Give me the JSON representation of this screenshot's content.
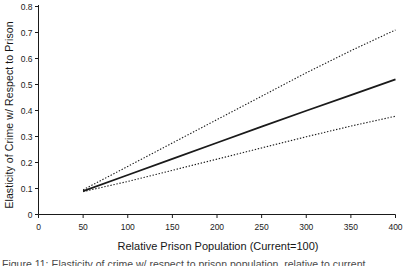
{
  "chart_data": {
    "type": "line",
    "title": "",
    "xlabel": "Relative Prison Population (Current=100)",
    "ylabel": "Elasticity of Crime w/ Respect to Prison",
    "xlim": [
      0,
      400
    ],
    "ylim": [
      0,
      0.8
    ],
    "xticks": [
      0,
      50,
      100,
      150,
      200,
      250,
      300,
      350,
      400
    ],
    "xtick_labels": [
      "0",
      "50",
      "100",
      "150",
      "200",
      "250",
      "300",
      "350",
      "400"
    ],
    "yticks": [
      0,
      0.1,
      0.2,
      0.3,
      0.4,
      0.5,
      0.6,
      0.7,
      0.8
    ],
    "ytick_labels": [
      "0",
      "0.1",
      "0.2",
      "0.3",
      "0.4",
      "0.5",
      "0.6",
      "0.7",
      "0.8"
    ],
    "grid": false,
    "legend": "none",
    "x": [
      50,
      100,
      150,
      200,
      250,
      300,
      350,
      400
    ],
    "series": [
      {
        "name": "Upper confidence bound",
        "style": "dotted",
        "color": "#1a1a1a",
        "values": [
          0.095,
          0.185,
          0.275,
          0.365,
          0.455,
          0.545,
          0.63,
          0.71
        ]
      },
      {
        "name": "Estimated elasticity",
        "style": "solid",
        "color": "#1a1a1a",
        "values": [
          0.09,
          0.152,
          0.214,
          0.276,
          0.338,
          0.399,
          0.459,
          0.52
        ]
      },
      {
        "name": "Lower confidence bound",
        "style": "dotted",
        "color": "#1a1a1a",
        "values": [
          0.088,
          0.127,
          0.17,
          0.213,
          0.256,
          0.299,
          0.34,
          0.378
        ]
      }
    ]
  },
  "figure": {
    "caption": "Figure 11: Elasticity of crime w/ respect to prison population, relative to current"
  },
  "axes": {
    "x_axis_name": "x-axis",
    "y_axis_name": "y-axis"
  }
}
